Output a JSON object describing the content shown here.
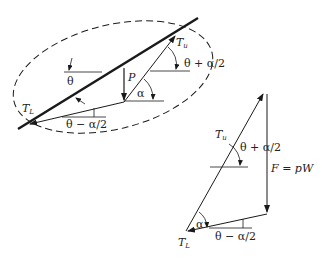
{
  "diagram": {
    "colors": {
      "line": "#1a1a1a",
      "background": "#ffffff"
    },
    "free_body": {
      "labels": {
        "T_upper": "T",
        "T_upper_sub": "u",
        "T_lower": "T",
        "T_lower_sub": "L",
        "P": "P",
        "theta": "θ",
        "alpha": "α",
        "theta_plus": "θ + α/2",
        "theta_minus": "θ − α/2"
      }
    },
    "force_triangle": {
      "labels": {
        "T_upper": "T",
        "T_upper_sub": "u",
        "T_lower": "T",
        "T_lower_sub": "L",
        "alpha": "α",
        "theta_plus": "θ + α/2",
        "theta_minus": "θ − α/2",
        "force": "F = pW"
      }
    }
  }
}
